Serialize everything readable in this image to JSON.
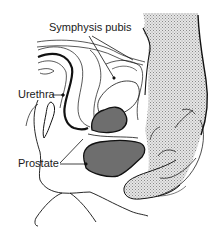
{
  "diagram": {
    "labels": {
      "symphysis": "Symphysis pubis",
      "urethra": "Urethra",
      "prostate": "Prostate"
    },
    "colors": {
      "line": "#111111",
      "prostate_fill": "#6e6e6e",
      "finger_fill": "#d4d4d4",
      "background": "#ffffff"
    }
  }
}
